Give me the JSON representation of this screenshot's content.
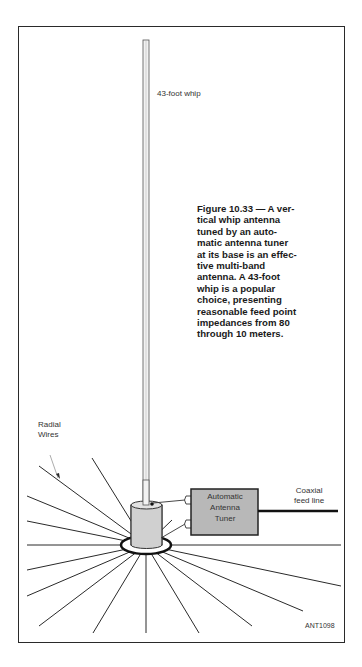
{
  "figure": {
    "id_tag": "ANT1098",
    "whip_label": "43-foot whip",
    "radial_label_lines": [
      "Radial",
      "Wires"
    ],
    "coax_label_lines": [
      "Coaxial",
      "feed line"
    ],
    "tuner_label_lines": [
      "Automatic",
      "Antenna",
      "Tuner"
    ],
    "caption_lines": [
      "Figure 10.33 — A ver-",
      "tical whip antenna",
      "tuned by an auto-",
      "matic antenna tuner",
      "at its base is an effec-",
      "tive multi-band",
      "antenna. A 43-foot",
      "whip is a popular",
      "choice, presenting",
      "reasonable feed point",
      "impedances from 80",
      "through 10 meters."
    ],
    "colors": {
      "line": "#2a2a2a",
      "tuner_fill": "#b8b8b8",
      "cylinder_fill": "#d0d0d0",
      "whip_fill": "#f2f2f2",
      "text": "#333333"
    }
  }
}
